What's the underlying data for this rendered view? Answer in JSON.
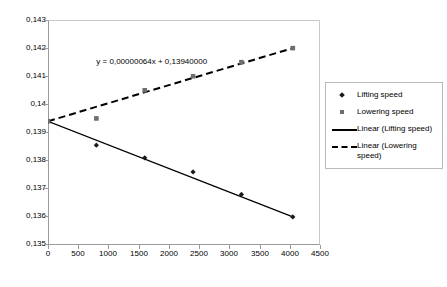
{
  "chart_data": {
    "type": "scatter",
    "title": "",
    "xlabel": "",
    "ylabel": "",
    "xlim": [
      0,
      4500
    ],
    "ylim": [
      0.135,
      0.143
    ],
    "xticks": [
      "0",
      "500",
      "1000",
      "1500",
      "2000",
      "2500",
      "3000",
      "3500",
      "4000",
      "4500"
    ],
    "yticks": [
      "0,135",
      "0,136",
      "0,137",
      "0,138",
      "0,139",
      "0,14",
      "0,141",
      "0,142",
      "0,143"
    ],
    "grid": false,
    "legend_position": "right",
    "annotations": [
      {
        "text": "y = 0,00000064x + 0,13940000",
        "x": 800,
        "y": 0.1417
      }
    ],
    "series": [
      {
        "name": "Lifting speed",
        "type": "scatter",
        "marker": "diamond",
        "color": "#1a1a1a",
        "x": [
          0,
          800,
          1600,
          2400,
          3200,
          4050
        ],
        "y": [
          0.1394,
          0.13855,
          0.1381,
          0.1376,
          0.1368,
          0.136
        ]
      },
      {
        "name": "Lowering speed",
        "type": "scatter",
        "marker": "square",
        "color": "#6e6e6e",
        "x": [
          0,
          800,
          1600,
          2400,
          3200,
          4050
        ],
        "y": [
          0.1394,
          0.1395,
          0.1405,
          0.141,
          0.1415,
          0.142
        ]
      },
      {
        "name": "Linear (Lifting speed)",
        "type": "line",
        "style": "solid",
        "color": "#000000",
        "x": [
          0,
          4050
        ],
        "y": [
          0.1394,
          0.136
        ]
      },
      {
        "name": "Linear (Lowering speed)",
        "type": "line",
        "style": "dashed",
        "color": "#000000",
        "x": [
          0,
          4050
        ],
        "y": [
          0.1394,
          0.142
        ]
      }
    ]
  },
  "legend": {
    "entries": [
      {
        "label": "Lifting speed",
        "key": "diamond-marker-icon"
      },
      {
        "label": "Lowering speed",
        "key": "square-marker-icon"
      },
      {
        "label": "Linear (Lifting speed)",
        "key": "solid-line-icon"
      },
      {
        "label": "Linear (Lowering speed)",
        "key": "dashed-line-icon"
      }
    ]
  }
}
